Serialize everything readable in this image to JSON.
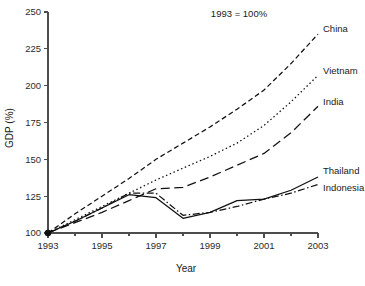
{
  "chart_data": {
    "type": "line",
    "title": "",
    "annotation": "1993 = 100%",
    "xlabel": "Year",
    "ylabel": "GDP (%)",
    "xlim": [
      1993,
      2003
    ],
    "ylim": [
      100,
      250
    ],
    "grid": false,
    "legend_position": "right-inline-labels",
    "x": [
      1993,
      1994,
      1995,
      1996,
      1997,
      1998,
      1999,
      2000,
      2001,
      2002,
      2003
    ],
    "y_ticks": [
      100,
      125,
      150,
      175,
      200,
      225,
      250
    ],
    "y_tick_labels": [
      "100",
      "125",
      "150",
      "175",
      "200",
      "225",
      "250"
    ],
    "x_ticks": [
      1993,
      1995,
      1997,
      1999,
      2001,
      2003
    ],
    "x_tick_labels": [
      "1993",
      "1995",
      "1997",
      "1999",
      "2001",
      "2003"
    ],
    "x_minor_ticks": [
      1994,
      1996,
      1998,
      2000,
      2002
    ],
    "series": [
      {
        "name": "China",
        "label": "China",
        "style": "short-dash",
        "dash": "5,3",
        "width": 1.35,
        "values": [
          100,
          113,
          125,
          137,
          150,
          161,
          172,
          184,
          197,
          215,
          235
        ]
      },
      {
        "name": "Vietnam",
        "label": "Vietnam",
        "style": "dotted",
        "dash": "1.5,2.6",
        "width": 1.35,
        "values": [
          100,
          109,
          118,
          127,
          136,
          144,
          152,
          161,
          173,
          189,
          207
        ]
      },
      {
        "name": "India",
        "label": "India",
        "style": "long-dash",
        "dash": "9,4.5",
        "width": 1.45,
        "values": [
          100,
          107,
          114,
          122,
          130,
          131,
          138,
          146,
          154,
          168,
          186
        ]
      },
      {
        "name": "Thailand",
        "label": "Thailand",
        "style": "solid",
        "dash": "none",
        "width": 1.35,
        "values": [
          100,
          108,
          117,
          126,
          124,
          110,
          114,
          122,
          123,
          129,
          138
        ]
      },
      {
        "name": "Indonesia",
        "label": "Indonesia",
        "style": "dash-dot",
        "dash": "7,2.5,1.5,2.5",
        "width": 1.35,
        "values": [
          100,
          108,
          117,
          127,
          127,
          112,
          114,
          118,
          123,
          127,
          133
        ]
      }
    ],
    "origin_marker": {
      "x": 1993,
      "y": 100,
      "shape": "circle"
    },
    "colors": {
      "line": "#111111",
      "axis": "#4d4d4d",
      "text": "#1a1a1a",
      "background": "#ffffff"
    }
  }
}
